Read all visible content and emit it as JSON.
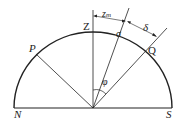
{
  "diagram": {
    "type": "celestial-meridian-semicircle",
    "labels": {
      "zenith": "Z",
      "north": "N",
      "south": "S",
      "point_p": "P",
      "point_q": "Q",
      "sigma": "σ",
      "delta": "δ",
      "phi": "φ",
      "zm_main": "z",
      "zm_sub": "m"
    },
    "colors": {
      "stroke": "#222222",
      "background": "#ffffff"
    }
  }
}
